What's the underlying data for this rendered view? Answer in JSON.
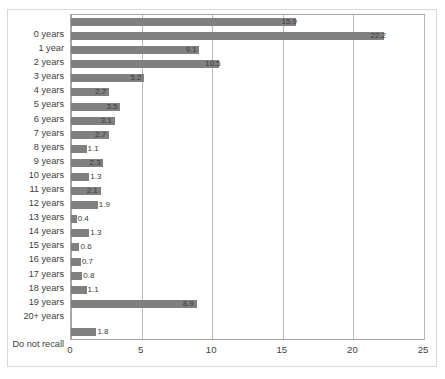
{
  "chart_data": {
    "type": "bar",
    "orientation": "horizontal",
    "title": "",
    "xlabel": "",
    "ylabel": "",
    "xlim": [
      0,
      25
    ],
    "xticks": [
      0,
      5,
      10,
      15,
      20,
      25
    ],
    "xtick_labels": [
      "0",
      "5",
      "10",
      "15",
      "20",
      "25"
    ],
    "grid": true,
    "legend": false,
    "bar_color": "#808080",
    "categories": [
      "0 years",
      "1 year",
      "2 years",
      "3 years",
      "4 years",
      "5 years",
      "6 years",
      "7 years",
      "8 years",
      "9 years",
      "10 years",
      "11 years",
      "12 years",
      "13 years",
      "14 years",
      "15 years",
      "16 years",
      "17 years",
      "18 years",
      "19 years",
      "20+ years",
      "",
      "Do not recall"
    ],
    "values": [
      15.9,
      22.2,
      9.1,
      10.5,
      5.2,
      2.7,
      3.5,
      3.1,
      2.7,
      1.1,
      2.3,
      1.3,
      2.1,
      1.9,
      0.4,
      1.3,
      0.6,
      0.7,
      0.8,
      1.1,
      8.9,
      null,
      1.8
    ],
    "data_labels": [
      "15.9",
      "22.2",
      "9.1",
      "10.5",
      "5.2",
      "2.7",
      "3.5",
      "3.1",
      "2.7",
      "1.1",
      "2.3",
      "1.3",
      "2.1",
      "1.9",
      "0.4",
      "1.3",
      "0.6",
      "0.7",
      "0.8",
      "1.1",
      "8.9",
      "",
      "1.8"
    ]
  }
}
